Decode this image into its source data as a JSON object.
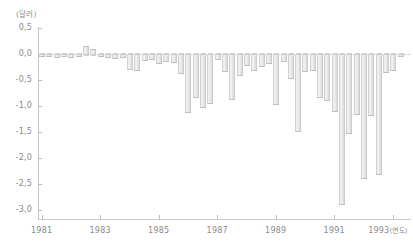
{
  "chart_data": {
    "type": "bar",
    "title": "",
    "subtitle": "",
    "xlabel": "(연도)",
    "ylabel": "(달러)",
    "y_unit_label": "(달러)",
    "x_unit_label": "(연도)",
    "grid": false,
    "legend": null,
    "ylim": [
      -3.0,
      0.5
    ],
    "xlim": [
      1980.875,
      1993.625
    ],
    "ytick_labels": [
      "0,5",
      "0,0",
      "-0,5",
      "-1,0",
      "-1,5",
      "-2,0",
      "-2,5",
      "-3,0"
    ],
    "ytick_values": [
      0.5,
      0.0,
      -0.5,
      -1.0,
      -1.5,
      -2.0,
      -2.5,
      -3.0
    ],
    "xtick_labels": [
      "1981",
      "1983",
      "1985",
      "1987",
      "1989",
      "1991",
      "1993"
    ],
    "xtick_values": [
      1981,
      1983,
      1985,
      1987,
      1989,
      1991,
      1993
    ],
    "bar_color": "#e4e4e4",
    "axis_color": "#c9c9c9",
    "text_color": "#8a8a8a",
    "x": [
      1981.0,
      1981.25,
      1981.5,
      1981.75,
      1982.0,
      1982.25,
      1982.5,
      1982.75,
      1983.0,
      1983.25,
      1983.5,
      1983.75,
      1984.0,
      1984.25,
      1984.5,
      1984.75,
      1985.0,
      1985.25,
      1985.5,
      1985.75,
      1986.0,
      1986.25,
      1986.5,
      1986.75,
      1987.0,
      1987.25,
      1987.5,
      1987.75,
      1988.0,
      1988.25,
      1988.5,
      1988.75,
      1989.0,
      1989.25,
      1989.5,
      1989.75,
      1990.0,
      1990.25,
      1990.5,
      1990.75,
      1991.0,
      1991.25,
      1991.5,
      1991.75,
      1992.0,
      1992.25,
      1992.5,
      1992.75,
      1993.0,
      1993.25
    ],
    "values": [
      -0.02,
      -0.04,
      -0.05,
      -0.04,
      -0.05,
      -0.03,
      0.16,
      0.1,
      -0.03,
      -0.06,
      -0.08,
      -0.05,
      -0.28,
      -0.3,
      -0.12,
      -0.1,
      -0.18,
      -0.14,
      -0.16,
      -0.36,
      -1.12,
      -0.82,
      -1.02,
      -0.95,
      -0.1,
      -0.32,
      -0.86,
      -0.4,
      -0.22,
      -0.3,
      -0.24,
      -0.18,
      -0.96,
      -0.14,
      -0.46,
      -1.48,
      -0.32,
      -0.3,
      -0.82,
      -0.88,
      -1.1,
      -2.88,
      -1.52,
      -1.16,
      -2.38,
      -1.18,
      -2.3,
      -0.34,
      -0.3,
      -0.04
    ]
  }
}
